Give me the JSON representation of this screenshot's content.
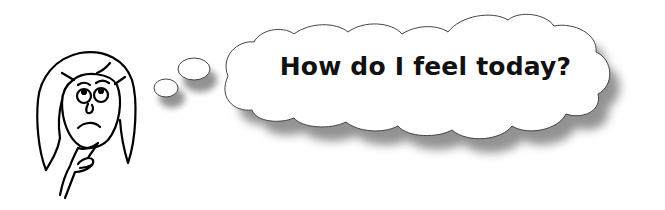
{
  "thought_bubble": {
    "text": "How do I feel today?"
  },
  "illustration": {
    "character": "girl-thinking",
    "expression": "worried",
    "pose": "hand-on-chin"
  },
  "colors": {
    "background": "#ffffff",
    "line": "#000000",
    "cloud_fill": "#ffffff",
    "cloud_outline": "#444444",
    "shadow": "#6e6e6e",
    "text": "#111111"
  }
}
